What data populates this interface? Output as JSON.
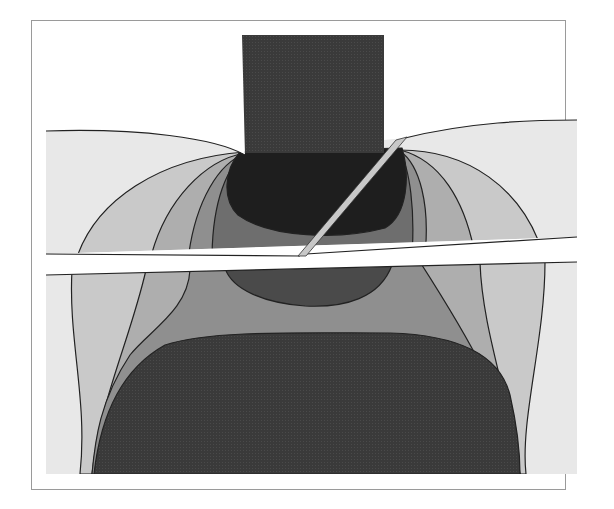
{
  "figure": {
    "type": "contour-diagram",
    "colors": {
      "background": "#ffffff",
      "frame": "#9a9a9a",
      "level_1_lightest": "#e8e8e8",
      "level_2": "#c9c9c9",
      "level_3": "#aeaeae",
      "level_4": "#8f8f8f",
      "level_5": "#6e6e6e",
      "level_6": "#4a4a4a",
      "level_7_darkest": "#1e1e1e",
      "block": "#3c3c3c",
      "blade": "#c8c8c8",
      "gap": "#ffffff",
      "contour_line": "#222222"
    },
    "regions": [
      {
        "name": "loading-block",
        "shade": "block"
      },
      {
        "name": "upper-contour-fan-left",
        "shade_levels": [
          "level_1_lightest",
          "level_2",
          "level_3",
          "level_4",
          "level_5"
        ]
      },
      {
        "name": "upper-contour-fan-right",
        "shade_levels": [
          "level_1_lightest",
          "level_2",
          "level_3",
          "level_4",
          "level_5"
        ]
      },
      {
        "name": "contact-core",
        "shade": "level_7_darkest"
      },
      {
        "name": "horizontal-gap",
        "shade": "gap"
      },
      {
        "name": "inclined-blade",
        "shade": "blade"
      },
      {
        "name": "lower-contour-bands",
        "shade_levels": [
          "level_1_lightest",
          "level_2",
          "level_3",
          "level_4",
          "level_6"
        ]
      },
      {
        "name": "lower-dark-region",
        "shade": "block"
      }
    ]
  }
}
